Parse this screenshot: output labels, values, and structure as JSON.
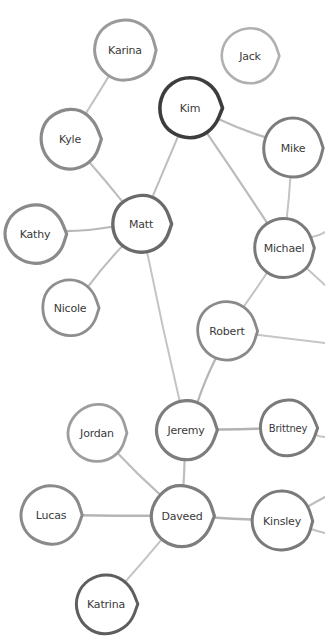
{
  "graph": {
    "title": "Social Network Graph",
    "background_color": "#ffffff",
    "default_node_stroke": "#8c8c8c",
    "default_edge_stroke": "#b8b8b8",
    "node_fill": "#ffffff",
    "label_color": "#3a3a3a",
    "width": 325,
    "height": 641,
    "nodes": [
      {
        "id": "karina",
        "label": "Karina",
        "cx": 125,
        "cy": 50,
        "r": 32,
        "stroke": "#9a9a9a",
        "stroke_width": 3.0,
        "font_size": 11
      },
      {
        "id": "jack",
        "label": "Jack",
        "cx": 250,
        "cy": 56,
        "r": 29,
        "stroke": "#b0b0b0",
        "stroke_width": 2.6,
        "font_size": 11
      },
      {
        "id": "kim",
        "label": "Kim",
        "cx": 190,
        "cy": 108,
        "r": 32,
        "stroke": "#3d3d3d",
        "stroke_width": 3.6,
        "font_size": 11
      },
      {
        "id": "kyle",
        "label": "Kyle",
        "cx": 70,
        "cy": 139,
        "r": 31,
        "stroke": "#8a8a8a",
        "stroke_width": 3.2,
        "font_size": 11
      },
      {
        "id": "mike",
        "label": "Mike",
        "cx": 293,
        "cy": 148,
        "r": 31,
        "stroke": "#7d7d7d",
        "stroke_width": 3.0,
        "font_size": 11
      },
      {
        "id": "kathy",
        "label": "Kathy",
        "cx": 35,
        "cy": 234,
        "r": 31,
        "stroke": "#8a8a8a",
        "stroke_width": 3.2,
        "font_size": 11
      },
      {
        "id": "matt",
        "label": "Matt",
        "cx": 141,
        "cy": 224,
        "r": 30,
        "stroke": "#6a6a6a",
        "stroke_width": 3.4,
        "font_size": 11
      },
      {
        "id": "michael",
        "label": "Michael",
        "cx": 284,
        "cy": 248,
        "r": 31,
        "stroke": "#7a7a7a",
        "stroke_width": 3.0,
        "font_size": 11
      },
      {
        "id": "nicole",
        "label": "Nicole",
        "cx": 70,
        "cy": 308,
        "r": 29,
        "stroke": "#8e8e8e",
        "stroke_width": 2.8,
        "font_size": 11
      },
      {
        "id": "robert",
        "label": "Robert",
        "cx": 227,
        "cy": 331,
        "r": 31,
        "stroke": "#8a8a8a",
        "stroke_width": 2.8,
        "font_size": 11
      },
      {
        "id": "jordan",
        "label": "Jordan",
        "cx": 97,
        "cy": 433,
        "r": 30,
        "stroke": "#9e9e9e",
        "stroke_width": 2.8,
        "font_size": 11
      },
      {
        "id": "jeremy",
        "label": "Jeremy",
        "cx": 186,
        "cy": 430,
        "r": 31,
        "stroke": "#7d7d7d",
        "stroke_width": 3.2,
        "font_size": 11
      },
      {
        "id": "brittney",
        "label": "Brittney",
        "cx": 288,
        "cy": 428,
        "r": 29,
        "stroke": "#7a7a7a",
        "stroke_width": 3.0,
        "font_size": 10
      },
      {
        "id": "lucas",
        "label": "Lucas",
        "cx": 51,
        "cy": 515,
        "r": 31,
        "stroke": "#8a8a8a",
        "stroke_width": 3.0,
        "font_size": 11
      },
      {
        "id": "daveed",
        "label": "Daveed",
        "cx": 182,
        "cy": 516,
        "r": 32,
        "stroke": "#7d7d7d",
        "stroke_width": 3.2,
        "font_size": 11
      },
      {
        "id": "kinsley",
        "label": "Kinsley",
        "cx": 282,
        "cy": 521,
        "r": 31,
        "stroke": "#7a7a7a",
        "stroke_width": 3.0,
        "font_size": 11
      },
      {
        "id": "katrina",
        "label": "Katrina",
        "cx": 106,
        "cy": 604,
        "r": 31,
        "stroke": "#5e5e5e",
        "stroke_width": 3.0,
        "font_size": 11
      }
    ],
    "edges": [
      {
        "source": "karina",
        "target": "kyle",
        "stroke": "#c2c2c2",
        "stroke_width": 2.0
      },
      {
        "source": "kyle",
        "target": "matt",
        "stroke": "#bdbdbd",
        "stroke_width": 2.0
      },
      {
        "source": "kim",
        "target": "matt",
        "stroke": "#bdbdbd",
        "stroke_width": 2.0
      },
      {
        "source": "kim",
        "target": "mike",
        "stroke": "#bcbcbc",
        "stroke_width": 2.4
      },
      {
        "source": "kim",
        "target": "michael",
        "stroke": "#bcbcbc",
        "stroke_width": 2.2
      },
      {
        "source": "mike",
        "target": "michael",
        "stroke": "#c4c4c4",
        "stroke_width": 2.0
      },
      {
        "source": "kathy",
        "target": "matt",
        "stroke": "#b8b8b8",
        "stroke_width": 2.2
      },
      {
        "source": "matt",
        "target": "nicole",
        "stroke": "#bdbdbd",
        "stroke_width": 2.0
      },
      {
        "source": "matt",
        "target": "jeremy",
        "stroke": "#c4c4c4",
        "stroke_width": 2.0
      },
      {
        "source": "michael",
        "target": "robert",
        "stroke": "#c4c4c4",
        "stroke_width": 2.0
      },
      {
        "source": "robert",
        "target": "jeremy",
        "stroke": "#b5b5b5",
        "stroke_width": 2.2
      },
      {
        "source": "jeremy",
        "target": "brittney",
        "stroke": "#b2b2b2",
        "stroke_width": 2.4
      },
      {
        "source": "jeremy",
        "target": "daveed",
        "stroke": "#bdbdbd",
        "stroke_width": 2.2
      },
      {
        "source": "jordan",
        "target": "daveed",
        "stroke": "#bdbdbd",
        "stroke_width": 2.2
      },
      {
        "source": "lucas",
        "target": "daveed",
        "stroke": "#b5b5b5",
        "stroke_width": 2.4
      },
      {
        "source": "daveed",
        "target": "kinsley",
        "stroke": "#b5b5b5",
        "stroke_width": 2.4
      },
      {
        "source": "daveed",
        "target": "katrina",
        "stroke": "#c4c4c4",
        "stroke_width": 2.0
      }
    ],
    "clipped_edges": [
      {
        "source": "michael",
        "x2": 325,
        "y2": 232,
        "stroke": "#c4c4c4",
        "stroke_width": 2.0
      },
      {
        "source": "michael",
        "x2": 325,
        "y2": 285,
        "stroke": "#c4c4c4",
        "stroke_width": 2.0
      },
      {
        "source": "robert",
        "x2": 325,
        "y2": 343,
        "stroke": "#c6c6c6",
        "stroke_width": 2.0
      },
      {
        "source": "brittney",
        "x2": 325,
        "y2": 437,
        "stroke": "#c2c2c2",
        "stroke_width": 2.0
      },
      {
        "source": "kinsley",
        "x2": 325,
        "y2": 497,
        "stroke": "#bcbcbc",
        "stroke_width": 2.2
      },
      {
        "source": "kinsley",
        "x2": 325,
        "y2": 533,
        "stroke": "#c2c2c2",
        "stroke_width": 2.0
      }
    ]
  }
}
